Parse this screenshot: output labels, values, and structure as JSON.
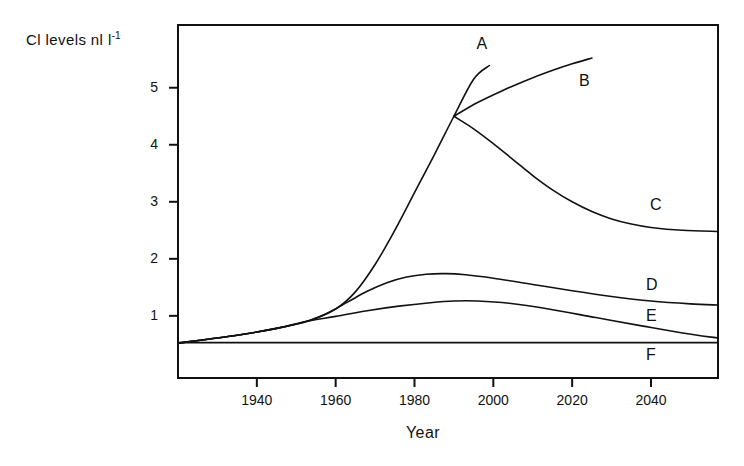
{
  "chart_data": {
    "type": "line",
    "title": "",
    "xlabel": "Year",
    "ylabel": "Cl levels nl l",
    "ylabel_exponent": "-1",
    "xlim": [
      1920,
      2057
    ],
    "ylim": [
      -0.09,
      6.1
    ],
    "xticks": [
      1940,
      1960,
      1980,
      2000,
      2020,
      2040
    ],
    "xticklabels": [
      "1940",
      "1960",
      "1980",
      "2000",
      "2020",
      "2040"
    ],
    "yticks": [
      1,
      2,
      3,
      4,
      5
    ],
    "yticklabels": [
      "1",
      "2",
      "3",
      "4",
      "5"
    ],
    "grid": false,
    "legend": "inline-end-labels",
    "line_color": "#111111",
    "background": "#ffffff",
    "series": [
      {
        "name": "A",
        "label": "A",
        "label_x": 1997,
        "label_y": 5.75,
        "points": [
          [
            1920,
            0.52
          ],
          [
            1935,
            0.66
          ],
          [
            1945,
            0.78
          ],
          [
            1953,
            0.91
          ],
          [
            1960,
            1.12
          ],
          [
            1965,
            1.42
          ],
          [
            1970,
            1.9
          ],
          [
            1975,
            2.5
          ],
          [
            1980,
            3.16
          ],
          [
            1985,
            3.82
          ],
          [
            1990,
            4.5
          ],
          [
            1995,
            5.15
          ],
          [
            1999,
            5.39
          ]
        ]
      },
      {
        "name": "B",
        "label": "B",
        "label_x": 2023,
        "label_y": 5.1,
        "points": [
          [
            1990,
            4.5
          ],
          [
            1996,
            4.74
          ],
          [
            2002,
            4.94
          ],
          [
            2008,
            5.12
          ],
          [
            2014,
            5.28
          ],
          [
            2020,
            5.42
          ],
          [
            2025,
            5.52
          ]
        ]
      },
      {
        "name": "C",
        "label": "C",
        "label_x": 2041,
        "label_y": 2.92,
        "points": [
          [
            1990,
            4.5
          ],
          [
            1995,
            4.28
          ],
          [
            2000,
            4.02
          ],
          [
            2005,
            3.74
          ],
          [
            2010,
            3.46
          ],
          [
            2015,
            3.21
          ],
          [
            2020,
            3.0
          ],
          [
            2025,
            2.83
          ],
          [
            2030,
            2.7
          ],
          [
            2035,
            2.61
          ],
          [
            2040,
            2.55
          ],
          [
            2048,
            2.5
          ],
          [
            2057,
            2.48
          ]
        ]
      },
      {
        "name": "D",
        "label": "D",
        "label_x": 2040,
        "label_y": 1.52,
        "points": [
          [
            1920,
            0.52
          ],
          [
            1935,
            0.66
          ],
          [
            1945,
            0.78
          ],
          [
            1953,
            0.91
          ],
          [
            1958,
            1.05
          ],
          [
            1963,
            1.24
          ],
          [
            1968,
            1.43
          ],
          [
            1973,
            1.58
          ],
          [
            1978,
            1.68
          ],
          [
            1983,
            1.73
          ],
          [
            1988,
            1.74
          ],
          [
            1993,
            1.72
          ],
          [
            2000,
            1.66
          ],
          [
            2010,
            1.55
          ],
          [
            2020,
            1.44
          ],
          [
            2030,
            1.34
          ],
          [
            2040,
            1.26
          ],
          [
            2050,
            1.21
          ],
          [
            2057,
            1.19
          ]
        ]
      },
      {
        "name": "E",
        "label": "E",
        "label_x": 2040,
        "label_y": 0.98,
        "points": [
          [
            1920,
            0.52
          ],
          [
            1935,
            0.66
          ],
          [
            1945,
            0.78
          ],
          [
            1953,
            0.91
          ],
          [
            1960,
            0.99
          ],
          [
            1968,
            1.09
          ],
          [
            1976,
            1.17
          ],
          [
            1984,
            1.23
          ],
          [
            1990,
            1.26
          ],
          [
            1996,
            1.26
          ],
          [
            2004,
            1.22
          ],
          [
            2014,
            1.12
          ],
          [
            2026,
            0.97
          ],
          [
            2038,
            0.82
          ],
          [
            2048,
            0.7
          ],
          [
            2057,
            0.61
          ]
        ]
      },
      {
        "name": "F",
        "label": "F",
        "label_x": 2040,
        "label_y": 0.3,
        "points": [
          [
            1920,
            0.53
          ],
          [
            2057,
            0.53
          ]
        ]
      }
    ]
  }
}
